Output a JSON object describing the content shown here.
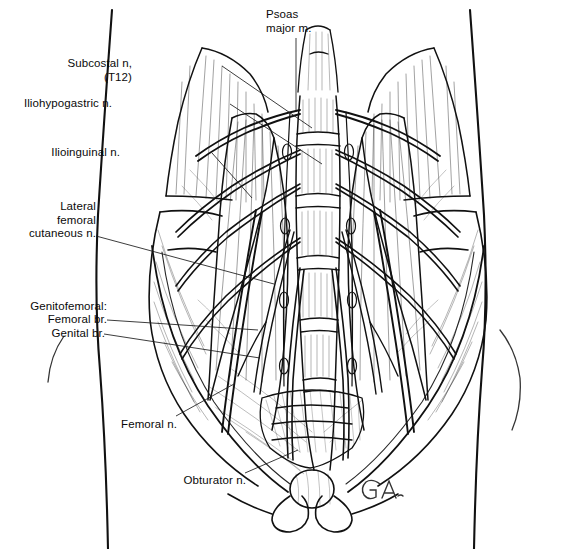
{
  "figure": {
    "medium": "pen-and-ink line illustration",
    "background_color": "#ffffff",
    "ink_color": "#111111",
    "signature": "G.A.",
    "signature_position": "bottom-center-right"
  },
  "labels": [
    {
      "id": "psoas-major",
      "text": "Psoas\nmajor m.",
      "lines": [
        "Psoas",
        "major m."
      ],
      "align": "left",
      "x": 266,
      "y": 8,
      "leader": [
        [
          296,
          38
        ],
        [
          296,
          112
        ]
      ]
    },
    {
      "id": "subcostal",
      "text": "Subcostal n,\n(T12)",
      "lines": [
        "Subcostal n,",
        "(T12)"
      ],
      "align": "right",
      "x": 131,
      "y": 57,
      "leader": [
        [
          222,
          66
        ],
        [
          312,
          128
        ]
      ]
    },
    {
      "id": "iliohypogastric",
      "text": "Iliohypogastric n.",
      "lines": [
        "Iliohypogastric n."
      ],
      "align": "right",
      "x": 111,
      "y": 97,
      "leader": [
        [
          230,
          104
        ],
        [
          322,
          164
        ]
      ]
    },
    {
      "id": "ilioinguinal",
      "text": "Ilioinguinal n.",
      "lines": [
        "Ilioinguinal n."
      ],
      "align": "right",
      "x": 119,
      "y": 146,
      "leader": [
        [
          212,
          153
        ],
        [
          250,
          196
        ]
      ]
    },
    {
      "id": "lateral-femoral-cutaneous",
      "text": "Lateral\nfemoral\ncutaneous n.",
      "lines": [
        "Lateral",
        "femoral",
        "cutaneous n."
      ],
      "align": "right",
      "x": 15,
      "y": 200,
      "leader": [
        [
          96,
          236
        ],
        [
          272,
          282
        ]
      ]
    },
    {
      "id": "genitofemoral",
      "text": "Genitofemoral:",
      "lines": [
        "Genitofemoral:"
      ],
      "align": "right",
      "x": 14,
      "y": 300,
      "leader": null
    },
    {
      "id": "genitofemoral-femoral-br",
      "text": "Femoral br.",
      "lines": [
        "Femoral br."
      ],
      "align": "right",
      "x": 33,
      "y": 313,
      "leader": [
        [
          107,
          320
        ],
        [
          256,
          330
        ]
      ]
    },
    {
      "id": "genitofemoral-genital-br",
      "text": "Genital br.",
      "lines": [
        "Genital br."
      ],
      "align": "right",
      "x": 38,
      "y": 327,
      "leader": [
        [
          104,
          334
        ],
        [
          258,
          356
        ]
      ]
    },
    {
      "id": "femoral",
      "text": "Femoral n.",
      "lines": [
        "Femoral n."
      ],
      "align": "right",
      "x": 114,
      "y": 418,
      "leader": [
        [
          176,
          416
        ],
        [
          232,
          386
        ]
      ]
    },
    {
      "id": "obturator",
      "text": "Obturator n.",
      "lines": [
        "Obturator n."
      ],
      "align": "right",
      "x": 176,
      "y": 474,
      "leader": [
        [
          245,
          473
        ],
        [
          296,
          452
        ]
      ]
    }
  ],
  "anatomy_notes": {
    "torso_outline": "abdominal / pelvic silhouette, waist narrowing at sides",
    "central_structure": "lumbar vertebral column L1-L5 with sacrum",
    "bilateral_muscles": "psoas major, quadratus lumborum, iliacus",
    "nerve_count": 8,
    "bottom_structure": "pubic symphysis and pubic rami"
  }
}
